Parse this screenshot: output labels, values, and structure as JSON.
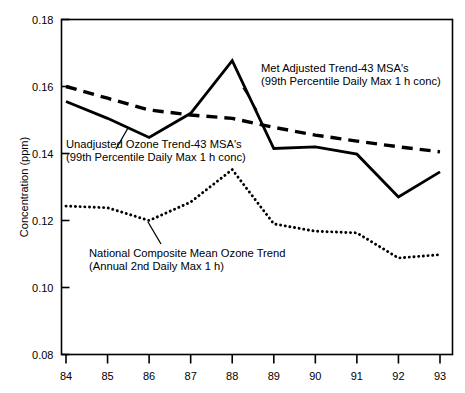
{
  "chart_data": {
    "type": "line",
    "title": "",
    "xlabel": "",
    "ylabel": "Concentration (ppm)",
    "x": [
      1984,
      1985,
      1986,
      1987,
      1988,
      1989,
      1990,
      1991,
      1992,
      1993
    ],
    "xtick_labels": [
      "84",
      "85",
      "86",
      "87",
      "88",
      "89",
      "90",
      "91",
      "92",
      "93"
    ],
    "ytick_labels": [
      "0.08",
      "0.10",
      "0.12",
      "0.14",
      "0.16",
      "0.18"
    ],
    "ytick_values": [
      0.08,
      0.1,
      0.12,
      0.14,
      0.16,
      0.18
    ],
    "xlim": [
      1984,
      1993
    ],
    "ylim": [
      0.08,
      0.18
    ],
    "grid": false,
    "legend_position": "inline-annotations",
    "series": [
      {
        "name": "Unadjusted Ozone Trend-43 MSA's (99th Percentile Daily Max 1 h conc)",
        "style": "solid",
        "values": [
          0.1555,
          0.1505,
          0.1448,
          0.152,
          0.1677,
          0.1415,
          0.142,
          0.1398,
          0.127,
          0.1345
        ]
      },
      {
        "name": "Met Adjusted Trend-43 MSA's (99th Percentile Daily Max 1 h conc)",
        "style": "dashed",
        "values": [
          0.16,
          0.1565,
          0.153,
          0.1515,
          0.1505,
          0.1478,
          0.1455,
          0.1437,
          0.142,
          0.1405
        ]
      },
      {
        "name": "National Composite Mean Ozone Trend (Annual 2nd Daily Max 1 h)",
        "style": "dotted",
        "values": [
          0.1243,
          0.1238,
          0.12,
          0.1255,
          0.1352,
          0.119,
          0.1168,
          0.1163,
          0.1088,
          0.1098
        ]
      }
    ],
    "annotations": [
      {
        "id": "unadjusted",
        "line1": "Unadjusted Ozone Trend-43 MSA's",
        "line2": "(99th Percentile Daily Max 1 h conc)"
      },
      {
        "id": "met-adjusted",
        "line1": "Met Adjusted Trend-43 MSA's",
        "line2": "(99th Percentile Daily Max 1 h conc)"
      },
      {
        "id": "national-composite",
        "line1": "National Composite Mean Ozone Trend",
        "line2": "(Annual 2nd Daily Max 1 h)"
      }
    ],
    "colors": {
      "line": "#000000",
      "axis": "#000000",
      "background": "#ffffff"
    }
  }
}
